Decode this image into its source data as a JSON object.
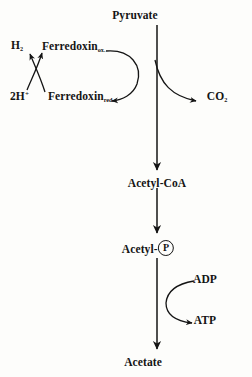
{
  "figure": {
    "background_color": "#fdfdfb",
    "ink_color": "#141414"
  },
  "nodes": {
    "pyruvate": "Pyruvate",
    "acetyl_coa": "Acetyl-CoA",
    "acetyl_phosphate_prefix": "Acetyl-",
    "acetyl_phosphate_group": "P",
    "acetate": "Acetate",
    "co2_text": "CO",
    "co2_sub": "2",
    "h2_text": "H",
    "h2_sub": "2",
    "two_h_text": "2H",
    "two_h_sup": "+",
    "ferredoxin_ox_text": "Ferredoxin",
    "ferredoxin_ox_sub": "ox.",
    "ferredoxin_red_text": "Ferredoxin",
    "ferredoxin_red_sub": "red.",
    "adp": "ADP",
    "atp": "ATP"
  },
  "arrows": {
    "main_spine": "vertical-reaction-spine",
    "co2_release": "pyruvate-to-co2-curved-arrow",
    "ferredoxin_cycle": "ferredoxin-ox-to-red-arc",
    "hydrogen_cross_left": "two-h-plus-to-h2-arrow",
    "hydrogen_cross_right": "ferredoxin-red-to-ox-arrow",
    "adp_in": "adp-input-curved-arrow",
    "atp_out": "atp-output-curved-arrow"
  }
}
